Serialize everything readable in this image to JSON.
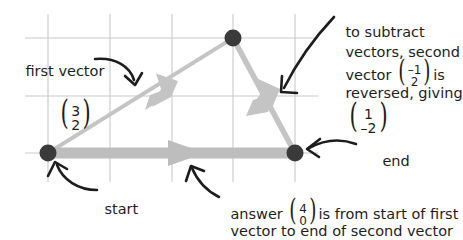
{
  "figure": {
    "colors": {
      "grid": "#c9c9c9",
      "vector": "#c4c4c4",
      "dot": "#3a3a3a",
      "ink": "#1d1d1d",
      "background": "#ffffff"
    },
    "grid": {
      "x_lines": [
        48,
        110,
        172,
        233,
        295
      ],
      "y_lines": [
        38,
        96,
        153
      ],
      "spacing": 62
    },
    "points": [
      {
        "name": "start",
        "x": 48,
        "y": 153
      },
      {
        "name": "apex",
        "x": 233,
        "y": 38
      },
      {
        "name": "end",
        "x": 295,
        "y": 153
      }
    ],
    "vectors": [
      {
        "name": "first-vector",
        "from": "start",
        "to": "apex",
        "components": "3, 2"
      },
      {
        "name": "second-vector-reversed",
        "from": "apex",
        "to": "end",
        "components": "1, -2"
      },
      {
        "name": "answer-vector",
        "from": "start",
        "to": "end",
        "components": "4, 0"
      }
    ]
  },
  "annotations": {
    "first_vector": {
      "label": "first vector",
      "vector_top": "3",
      "vector_bottom": "2"
    },
    "subtract_note": {
      "line1": "to subtract",
      "line2": "vectors, second",
      "line3_pre": "vector ",
      "line3_vec_top": "–1",
      "line3_vec_bottom": "2",
      "line3_post": "is",
      "line4": "reversed, giving",
      "line5_vec_top": "1",
      "line5_vec_bottom": "–2"
    },
    "start": {
      "label": "start"
    },
    "end": {
      "label": "end"
    },
    "answer": {
      "pre": "answer ",
      "vec_top": "4",
      "vec_bottom": "0",
      "post": "is from start of first",
      "line2": "vector to end of second vector"
    }
  }
}
